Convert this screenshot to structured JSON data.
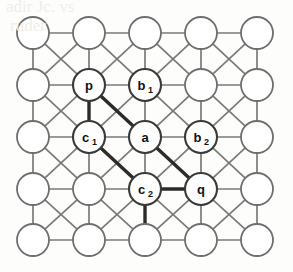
{
  "figure": {
    "canvas": {
      "width": 293,
      "height": 272,
      "background": "#fdfdfc"
    },
    "style": {
      "node_radius": 16,
      "node_fill": "#ffffff",
      "node_stroke": "#6e6e6c",
      "edge_color": "#7a7a78",
      "edge_width": 1.7,
      "bold_edge_color": "#2b2b2b",
      "bold_edge_width": 3.4,
      "label_color": "#111111"
    },
    "grid": {
      "rows": 5,
      "cols": 5,
      "col_x": [
        33,
        89,
        145,
        201,
        257
      ],
      "row_y": [
        33,
        85,
        137,
        189,
        240
      ]
    },
    "nodes": [
      {
        "id": "r0c0",
        "row": 0,
        "col": 0,
        "label": "",
        "sub": "",
        "labeled": false
      },
      {
        "id": "r0c1",
        "row": 0,
        "col": 1,
        "label": "",
        "sub": "",
        "labeled": false
      },
      {
        "id": "r0c2",
        "row": 0,
        "col": 2,
        "label": "",
        "sub": "",
        "labeled": false
      },
      {
        "id": "r0c3",
        "row": 0,
        "col": 3,
        "label": "",
        "sub": "",
        "labeled": false
      },
      {
        "id": "r0c4",
        "row": 0,
        "col": 4,
        "label": "",
        "sub": "",
        "labeled": false
      },
      {
        "id": "r1c0",
        "row": 1,
        "col": 0,
        "label": "",
        "sub": "",
        "labeled": false
      },
      {
        "id": "r1c1",
        "row": 1,
        "col": 1,
        "label": "p",
        "sub": "",
        "labeled": true
      },
      {
        "id": "r1c2",
        "row": 1,
        "col": 2,
        "label": "b",
        "sub": "1",
        "labeled": true
      },
      {
        "id": "r1c3",
        "row": 1,
        "col": 3,
        "label": "",
        "sub": "",
        "labeled": false
      },
      {
        "id": "r1c4",
        "row": 1,
        "col": 4,
        "label": "",
        "sub": "",
        "labeled": false
      },
      {
        "id": "r2c0",
        "row": 2,
        "col": 0,
        "label": "",
        "sub": "",
        "labeled": false
      },
      {
        "id": "r2c1",
        "row": 2,
        "col": 1,
        "label": "c",
        "sub": "1",
        "labeled": true
      },
      {
        "id": "r2c2",
        "row": 2,
        "col": 2,
        "label": "a",
        "sub": "",
        "labeled": true
      },
      {
        "id": "r2c3",
        "row": 2,
        "col": 3,
        "label": "b",
        "sub": "2",
        "labeled": true
      },
      {
        "id": "r2c4",
        "row": 2,
        "col": 4,
        "label": "",
        "sub": "",
        "labeled": false
      },
      {
        "id": "r3c0",
        "row": 3,
        "col": 0,
        "label": "",
        "sub": "",
        "labeled": false
      },
      {
        "id": "r3c1",
        "row": 3,
        "col": 1,
        "label": "",
        "sub": "",
        "labeled": false
      },
      {
        "id": "r3c2",
        "row": 3,
        "col": 2,
        "label": "c",
        "sub": "2",
        "labeled": true
      },
      {
        "id": "r3c3",
        "row": 3,
        "col": 3,
        "label": "q",
        "sub": "",
        "labeled": true
      },
      {
        "id": "r3c4",
        "row": 3,
        "col": 4,
        "label": "",
        "sub": "",
        "labeled": false
      },
      {
        "id": "r4c0",
        "row": 4,
        "col": 0,
        "label": "",
        "sub": "",
        "labeled": false
      },
      {
        "id": "r4c1",
        "row": 4,
        "col": 1,
        "label": "",
        "sub": "",
        "labeled": false
      },
      {
        "id": "r4c2",
        "row": 4,
        "col": 2,
        "label": "",
        "sub": "",
        "labeled": false
      },
      {
        "id": "r4c3",
        "row": 4,
        "col": 3,
        "label": "",
        "sub": "",
        "labeled": false
      },
      {
        "id": "r4c4",
        "row": 4,
        "col": 4,
        "label": "",
        "sub": "",
        "labeled": false
      }
    ],
    "bold_edges": [
      {
        "from": "r1c1",
        "to": "r2c1",
        "note": "p to c1, vertical"
      },
      {
        "from": "r1c1",
        "to": "r2c2",
        "note": "p to a, diagonal"
      },
      {
        "from": "r2c1",
        "to": "r3c2",
        "note": "c1 to c2, diagonal"
      },
      {
        "from": "r2c2",
        "to": "r3c3",
        "note": "a to q, diagonal"
      },
      {
        "from": "r3c2",
        "to": "r3c3",
        "note": "c2 to q, horizontal"
      },
      {
        "from": "r3c2",
        "to": "r4c2",
        "note": "c2 downward, vertical"
      }
    ],
    "labeled_node_ids": [
      "r1c1",
      "r1c2",
      "r2c1",
      "r2c2",
      "r2c3",
      "r3c2",
      "r3c3"
    ],
    "ghost_text": [
      {
        "text": "adir Jc. vs",
        "x": 6,
        "y": -2
      },
      {
        "text": "ruder",
        "x": 10,
        "y": 18
      },
      {
        "text": "a",
        "x": 120,
        "y": 14
      }
    ]
  }
}
